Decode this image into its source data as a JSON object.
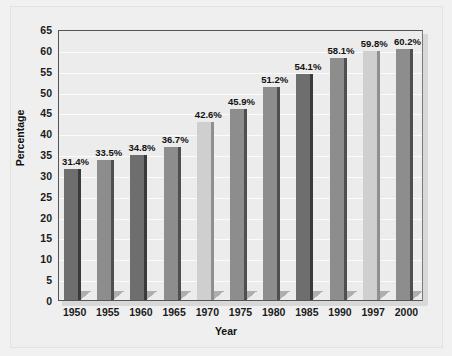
{
  "chart_data": {
    "type": "bar",
    "title": "",
    "xlabel": "Year",
    "ylabel": "Percentage",
    "categories": [
      "1950",
      "1955",
      "1960",
      "1965",
      "1970",
      "1975",
      "1980",
      "1985",
      "1990",
      "1997",
      "2000"
    ],
    "values": [
      31.4,
      33.5,
      34.8,
      36.7,
      42.6,
      45.9,
      51.2,
      54.1,
      58.1,
      59.8,
      60.2
    ],
    "value_labels": [
      "31.4%",
      "33.5%",
      "34.8%",
      "36.7%",
      "42.6%",
      "45.9%",
      "51.2%",
      "54.1%",
      "58.1%",
      "59.8%",
      "60.2%"
    ],
    "bar_colors": [
      "#6e6e6e",
      "#8d8d8d",
      "#6e6e6e",
      "#8d8d8d",
      "#cfcfcf",
      "#8d8d8d",
      "#8d8d8d",
      "#6e6e6e",
      "#8d8d8d",
      "#cfcfcf",
      "#8d8d8d"
    ],
    "bar_edge_colors": [
      "#3a3a3a",
      "#4f4f4f",
      "#3a3a3a",
      "#4f4f4f",
      "#8f8f8f",
      "#4f4f4f",
      "#4f4f4f",
      "#3a3a3a",
      "#4f4f4f",
      "#8f8f8f",
      "#4f4f4f"
    ],
    "ylim": [
      0,
      65
    ],
    "ytick_step": 5,
    "yticks": [
      "0",
      "5",
      "10",
      "15",
      "20",
      "25",
      "30",
      "35",
      "40",
      "45",
      "50",
      "55",
      "60",
      "65"
    ],
    "grid": true,
    "grid_color": "#fbfbfb",
    "legend": "none",
    "plot_background": "#ececec",
    "figure_background": "#efefef",
    "axis_color": "#555555"
  }
}
